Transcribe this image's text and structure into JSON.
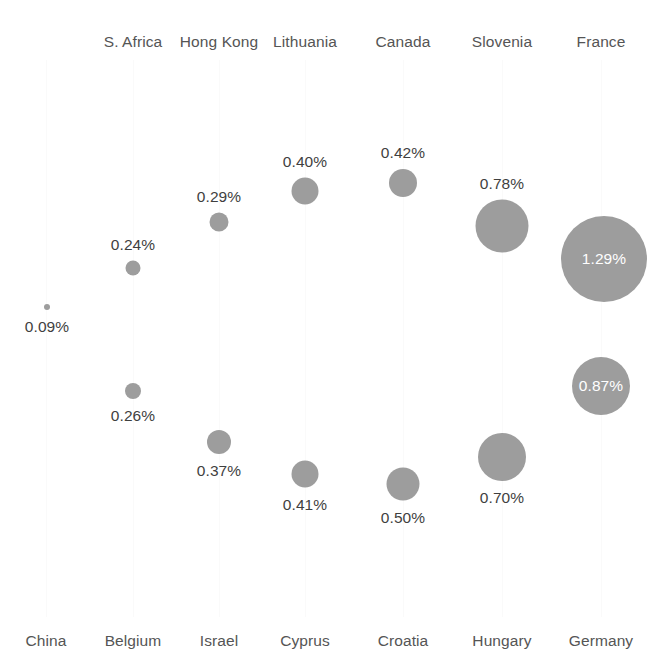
{
  "chart_data": {
    "type": "scatter",
    "title": "",
    "subtitle": "",
    "xlabel": "",
    "ylabel": "",
    "grid": true,
    "legend": "none",
    "value_unit": "%",
    "note": "Bubble chart: two rows of proportional circles, each column shares a vertical gridline. Top row labels appear above the plot, bottom row labels below.",
    "columns": [
      {
        "x": 46,
        "top_label": "",
        "bottom_label": "China"
      },
      {
        "x": 133,
        "top_label": "S. Africa",
        "bottom_label": "Belgium"
      },
      {
        "x": 219,
        "top_label": "Hong Kong",
        "bottom_label": "Israel"
      },
      {
        "x": 305,
        "top_label": "Lithuania",
        "bottom_label": "Cyprus"
      },
      {
        "x": 403,
        "top_label": "Canada",
        "bottom_label": "Croatia"
      },
      {
        "x": 502,
        "top_label": "Slovenia",
        "bottom_label": "Hungary"
      },
      {
        "x": 601,
        "top_label": "France",
        "bottom_label": "Germany"
      }
    ],
    "series": [
      {
        "name": "upper",
        "points": [
          {
            "category": "S. Africa",
            "value": 0.24,
            "label": "0.24%",
            "cx": 133,
            "cy": 268,
            "r": 7.5,
            "label_position": "above",
            "label_inside": false
          },
          {
            "category": "Hong Kong",
            "value": 0.29,
            "label": "0.29%",
            "cx": 219,
            "cy": 222,
            "r": 9.5,
            "label_position": "above",
            "label_inside": false
          },
          {
            "category": "Lithuania",
            "value": 0.4,
            "label": "0.40%",
            "cx": 305,
            "cy": 191,
            "r": 13.5,
            "label_position": "above",
            "label_inside": false
          },
          {
            "category": "Canada",
            "value": 0.42,
            "label": "0.42%",
            "cx": 403,
            "cy": 183,
            "r": 14.0,
            "label_position": "above",
            "label_inside": false
          },
          {
            "category": "Slovenia",
            "value": 0.78,
            "label": "0.78%",
            "cx": 502,
            "cy": 226,
            "r": 26.5,
            "label_position": "above",
            "label_inside": false
          },
          {
            "category": "France",
            "value": 1.29,
            "label": "1.29%",
            "cx": 604,
            "cy": 259,
            "r": 43.0,
            "label_position": "inside",
            "label_inside": true
          }
        ]
      },
      {
        "name": "lower",
        "points": [
          {
            "category": "China",
            "value": 0.09,
            "label": "0.09%",
            "cx": 47,
            "cy": 307,
            "r": 3.0,
            "label_position": "below",
            "label_inside": false
          },
          {
            "category": "Belgium",
            "value": 0.26,
            "label": "0.26%",
            "cx": 133,
            "cy": 391,
            "r": 8.0,
            "label_position": "below",
            "label_inside": false
          },
          {
            "category": "Israel",
            "value": 0.37,
            "label": "0.37%",
            "cx": 219,
            "cy": 442,
            "r": 12.0,
            "label_position": "below",
            "label_inside": false
          },
          {
            "category": "Cyprus",
            "value": 0.41,
            "label": "0.41%",
            "cx": 305,
            "cy": 474,
            "r": 13.5,
            "label_position": "below",
            "label_inside": false
          },
          {
            "category": "Croatia",
            "value": 0.5,
            "label": "0.50%",
            "cx": 403,
            "cy": 484,
            "r": 16.5,
            "label_position": "below",
            "label_inside": false
          },
          {
            "category": "Hungary",
            "value": 0.7,
            "label": "0.70%",
            "cx": 502,
            "cy": 457,
            "r": 24.0,
            "label_position": "below",
            "label_inside": false
          },
          {
            "category": "Germany",
            "value": 0.87,
            "label": "0.87%",
            "cx": 601,
            "cy": 386,
            "r": 29.0,
            "label_position": "inside",
            "label_inside": true
          }
        ]
      }
    ],
    "colors": {
      "bubble_fill": "#9d9d9d",
      "label_text": "#3f3f3f",
      "axis_text": "#555555",
      "gridline": "#fafafa",
      "inside_label_text": "#ffffff",
      "background": "#ffffff"
    }
  }
}
